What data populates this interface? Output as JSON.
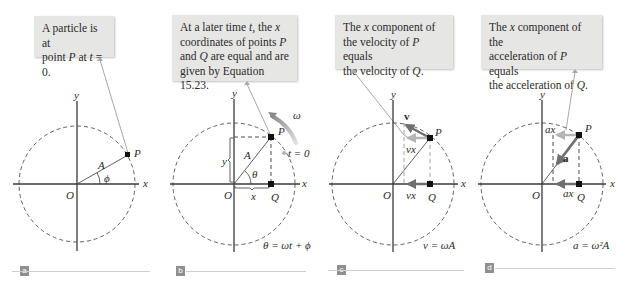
{
  "colors": {
    "callout_bg": "#e6e6e4",
    "leader_line": "#a8a8a8",
    "axis": "#3a3a3a",
    "vector_gray": "#8a8a8a",
    "vector_light": "#b4b4b4",
    "tag_bg": "#8f8f8f"
  },
  "panels": [
    {
      "tag": "a",
      "callout": "A particle is at point P at t = 0.",
      "labels": {
        "y": "y",
        "x": "x",
        "O": "O",
        "P": "P",
        "A": "A",
        "phi": "ϕ"
      },
      "equation": ""
    },
    {
      "tag": "b",
      "callout": "At a later time t, the x coordinates of points P and Q are equal and are given by Equation 15.23.",
      "labels": {
        "y": "y",
        "x": "x",
        "O": "O",
        "P": "P",
        "Q": "Q",
        "A": "A",
        "theta": "θ",
        "omega": "ω",
        "t0": "t = 0",
        "ycoord": "y",
        "xcoord": "x"
      },
      "equation": "θ = ωt + ϕ"
    },
    {
      "tag": "c",
      "callout": "The x component of the velocity of P equals the velocity of Q.",
      "labels": {
        "y": "y",
        "x": "x",
        "O": "O",
        "P": "P",
        "Q": "Q",
        "v_vec": "v⃗",
        "vx_top": "vx",
        "vx_bottom": "vx"
      },
      "equation": "v = ωA"
    },
    {
      "tag": "d",
      "callout": "The x component of the acceleration of P equals the acceleration of Q.",
      "labels": {
        "y": "y",
        "x": "x",
        "O": "O",
        "P": "P",
        "Q": "Q",
        "a_vec": "a⃗",
        "ax_top": "ax",
        "ax_bottom": "ax"
      },
      "equation": "a = ω²A"
    }
  ]
}
